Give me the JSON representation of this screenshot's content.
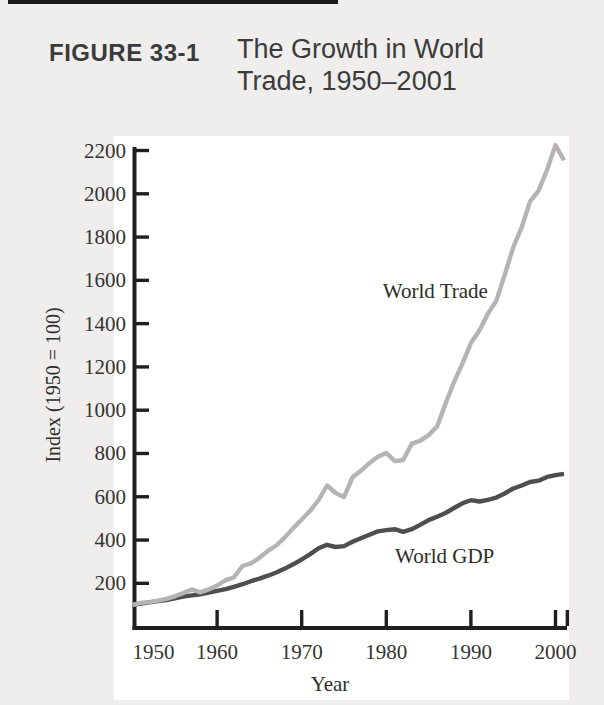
{
  "page": {
    "background": "#efeeec"
  },
  "header": {
    "figure_label": "FIGURE 33-1",
    "title_line1": "The Growth in World",
    "title_line2": "Trade, 1950–2001"
  },
  "chart_data": {
    "type": "line",
    "title": "The Growth in World Trade, 1950–2001",
    "xlabel": "Year",
    "ylabel": "Index (1950 = 100)",
    "grid": false,
    "legend": "inline-annotations",
    "xlim": [
      1950,
      2001.6
    ],
    "ylim": [
      0,
      2212
    ],
    "x_tick_labels": [
      "1950",
      "1960",
      "1970",
      "1980",
      "1990",
      "2000"
    ],
    "x_ticks_marked": [
      1960,
      1970,
      1980,
      1990,
      2000,
      2001.4
    ],
    "y_ticks": [
      200,
      400,
      600,
      800,
      1000,
      1200,
      1400,
      1600,
      1800,
      2000,
      2200
    ],
    "years": [
      1950,
      1951,
      1952,
      1953,
      1954,
      1955,
      1956,
      1957,
      1958,
      1959,
      1960,
      1961,
      1962,
      1963,
      1964,
      1965,
      1966,
      1967,
      1968,
      1969,
      1970,
      1971,
      1972,
      1973,
      1974,
      1975,
      1976,
      1977,
      1978,
      1979,
      1980,
      1981,
      1982,
      1983,
      1984,
      1985,
      1986,
      1987,
      1988,
      1989,
      1990,
      1991,
      1992,
      1993,
      1994,
      1995,
      1996,
      1997,
      1998,
      1999,
      2000,
      2001
    ],
    "series": [
      {
        "name": "World Trade",
        "color": "#b5b4b2",
        "values": [
          100,
          110,
          113,
          120,
          128,
          140,
          155,
          172,
          158,
          172,
          190,
          215,
          228,
          280,
          292,
          318,
          350,
          375,
          412,
          455,
          495,
          535,
          585,
          652,
          618,
          598,
          690,
          720,
          755,
          785,
          802,
          765,
          770,
          845,
          858,
          885,
          925,
          1030,
          1130,
          1215,
          1310,
          1368,
          1445,
          1505,
          1625,
          1752,
          1845,
          1965,
          2015,
          2110,
          2225,
          2155
        ]
      },
      {
        "name": "World GDP",
        "color": "#4e4e4e",
        "values": [
          100,
          106,
          112,
          118,
          123,
          131,
          138,
          144,
          149,
          157,
          165,
          173,
          184,
          196,
          210,
          222,
          235,
          250,
          268,
          288,
          310,
          335,
          362,
          378,
          368,
          372,
          392,
          408,
          424,
          440,
          446,
          450,
          438,
          450,
          470,
          492,
          508,
          525,
          548,
          570,
          584,
          578,
          586,
          596,
          615,
          638,
          652,
          668,
          674,
          692,
          700,
          706
        ]
      }
    ],
    "annotations": [
      {
        "text": "World Trade",
        "year": 1985.8,
        "value": 1551
      },
      {
        "text": "World GDP",
        "year": 1986.9,
        "value": 326
      }
    ],
    "axis_color": "#1f1f1f"
  }
}
